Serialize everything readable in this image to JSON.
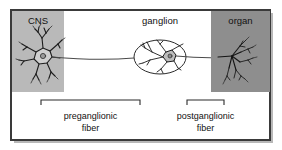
{
  "figure": {
    "frame": {
      "border_color": "#3a3a3a",
      "background_color": "#ffffff",
      "shadow_color": "#b8b8b8"
    },
    "panels": [
      {
        "id": "cns-panel",
        "label": "CNS",
        "fill": "#b9b9b9",
        "x": 12,
        "y": 11,
        "width": 52,
        "height": 81
      },
      {
        "id": "organ-panel",
        "label": "organ",
        "fill": "#8e8e8e",
        "x": 211,
        "y": 11,
        "width": 59,
        "height": 81
      }
    ],
    "ganglion": {
      "label": "ganglion",
      "cx": 160,
      "cy": 57,
      "rx": 26,
      "ry": 17,
      "stroke": "#2b2b2b",
      "fill": "#ffffff"
    },
    "axon": {
      "stroke": "#4a4a4a",
      "y": 58
    },
    "neuron_color": "#1d1d1d",
    "brackets": [
      {
        "id": "preganglionic-bracket",
        "label_line1": "preganglionic",
        "label_line2": "fiber",
        "x1": 41,
        "x2": 140,
        "y": 100,
        "tick_height": 5,
        "stroke": "#2b2b2b"
      },
      {
        "id": "postganglionic-bracket",
        "label_line1": "postganglionic",
        "label_line2": "fiber",
        "x1": 187,
        "x2": 224,
        "y": 100,
        "tick_height": 5,
        "stroke": "#2b2b2b"
      }
    ],
    "label_color": "#111111"
  }
}
